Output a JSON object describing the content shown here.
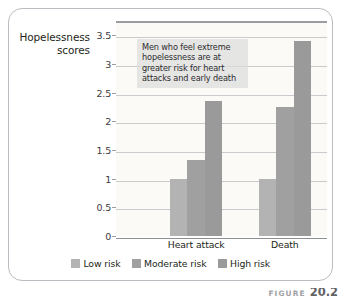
{
  "figure": {
    "caption_word": "FIGURE",
    "caption_number": "20.2"
  },
  "chart_data": {
    "type": "bar",
    "title": "",
    "xlabel": "",
    "ylabel": "Hopelessness scores",
    "ylabel_line1": "Hopelessness",
    "ylabel_line2": "scores",
    "categories": [
      "Heart attack",
      "Death"
    ],
    "series": [
      {
        "name": "Low risk",
        "values": [
          1.0,
          1.0
        ],
        "color": "#b3b3b3"
      },
      {
        "name": "Moderate risk",
        "values": [
          1.33,
          2.25
        ],
        "color": "#a0a0a0"
      },
      {
        "name": "High risk",
        "values": [
          2.35,
          3.4
        ],
        "color": "#9a9a9a"
      }
    ],
    "ylim": [
      0,
      3.75
    ],
    "yticks": [
      0,
      0.5,
      1,
      1.5,
      2,
      2.5,
      3,
      3.5
    ],
    "ytick_labels": [
      "0",
      "0.5",
      "1",
      "1.5",
      "2",
      "2.5",
      "3",
      "3.5"
    ],
    "grid": true,
    "legend_position": "bottom",
    "annotations": [
      {
        "text": "Men who feel extreme hopelessness are at greater risk for heart attacks and early death",
        "lines": [
          "Men who feel extreme",
          "hopelessness are at",
          "greater risk for heart",
          "attacks and early death"
        ]
      }
    ],
    "plot_background": "#fbfaf7",
    "gridline_color": "#c8cacd",
    "axis_color": "#9a9ea2"
  }
}
